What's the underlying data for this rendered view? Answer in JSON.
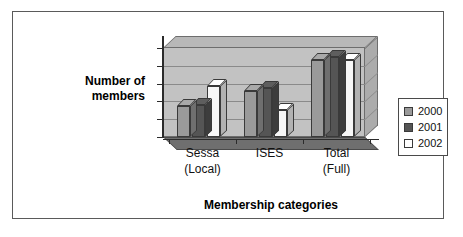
{
  "chart_data": {
    "type": "bar",
    "title": "",
    "subtitle": "",
    "xlabel": "Membership categories",
    "ylabel": "Number of members",
    "ylabel_line1": "Number of",
    "ylabel_line2": "members",
    "categories": [
      "Sessa (Local)",
      "ISES",
      "Total (Full)"
    ],
    "category_labels": [
      {
        "main": "Sessa",
        "sub": "(Local)"
      },
      {
        "main": "ISES",
        "sub": ""
      },
      {
        "main": "Total",
        "sub": "(Full)"
      }
    ],
    "series": [
      {
        "name": "2000",
        "color": "#9a9a9a",
        "values": [
          35,
          52,
          87
        ]
      },
      {
        "name": "2001",
        "color": "#555555",
        "values": [
          36,
          55,
          90
        ]
      },
      {
        "name": "2002",
        "color": "#f7f7f7",
        "values": [
          57,
          30,
          87
        ]
      }
    ],
    "ylim": [
      0,
      100
    ],
    "yticks": [
      0,
      20,
      40,
      60,
      80,
      100
    ],
    "ytick_labels": [
      "0",
      "20",
      "40",
      "60",
      "80",
      "100"
    ],
    "grid": true,
    "legend_position": "right",
    "style": "3d-column"
  },
  "legend": {
    "entries": [
      {
        "label": "2000",
        "color": "#9a9a9a"
      },
      {
        "label": "2001",
        "color": "#555555"
      },
      {
        "label": "2002",
        "color": "#ffffff"
      }
    ]
  },
  "colors": {
    "back_wall": "#c2c2c2",
    "top_slab": "#b8b8b8",
    "side_wall": "#acacac",
    "floor": "#6f6f6f",
    "frame_border": "#5a5a5a",
    "axis": "#2b2b2b",
    "gridline": "#8a8a8a",
    "text": "#111111"
  }
}
